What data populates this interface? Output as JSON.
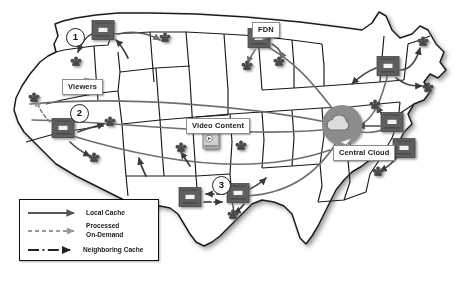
{
  "figure": {
    "kind": "network-diagram",
    "basemap": "united-states-map",
    "background_color": "#ffffff",
    "map_fill": "#ffffff",
    "map_stroke": "#1a1a1a",
    "accent_gray": "#6f6f6f",
    "server_color": "#5e5e5e",
    "cloud_circle_color": "#8c8c8c"
  },
  "labels": [
    {
      "id": "viewers",
      "text": "Viewers",
      "x": 62,
      "y": 79
    },
    {
      "id": "fdn",
      "text": "FDN",
      "x": 252,
      "y": 22
    },
    {
      "id": "video_content",
      "text": "Video Content",
      "x": 186,
      "y": 118
    },
    {
      "id": "central_cloud",
      "text": "Central Cloud",
      "x": 333,
      "y": 145
    }
  ],
  "markers": [
    {
      "id": "marker-1",
      "text": "1",
      "x": 66,
      "y": 28
    },
    {
      "id": "marker-2",
      "text": "2",
      "x": 70,
      "y": 104
    },
    {
      "id": "marker-3",
      "text": "3",
      "x": 212,
      "y": 176
    }
  ],
  "legend": {
    "title": "",
    "items": [
      {
        "id": "local-cache",
        "label": "Local Cache",
        "style": "solid",
        "color": "#555555"
      },
      {
        "id": "processed-on-demand",
        "label": "Processed\nOn-Demand",
        "style": "dashed",
        "color": "#9a9a9a"
      },
      {
        "id": "neighboring-cache",
        "label": "Neighboring Cache",
        "style": "dash-dot",
        "color": "#222222"
      }
    ],
    "line1": "Local Cache",
    "line2a": "Processed",
    "line2b": "On-Demand",
    "line3": "Neighboring Cache"
  },
  "nodes": {
    "servers": [
      {
        "id": "server-oregon",
        "x": 103,
        "y": 30
      },
      {
        "id": "server-california",
        "x": 63,
        "y": 128
      },
      {
        "id": "server-fdn-mn",
        "x": 259,
        "y": 38
      },
      {
        "id": "server-texas-w",
        "x": 190,
        "y": 197
      },
      {
        "id": "server-texas-e",
        "x": 238,
        "y": 193
      },
      {
        "id": "server-newyork",
        "x": 388,
        "y": 66
      },
      {
        "id": "server-midatl",
        "x": 392,
        "y": 122
      },
      {
        "id": "server-southeast",
        "x": 404,
        "y": 148
      }
    ],
    "viewer_clusters": [
      {
        "id": "viewers-oregon",
        "x": 76,
        "y": 62
      },
      {
        "id": "viewers-montana",
        "x": 165,
        "y": 38
      },
      {
        "id": "viewers-norcal",
        "x": 34,
        "y": 98
      },
      {
        "id": "viewers-nevada",
        "x": 110,
        "y": 122
      },
      {
        "id": "viewers-socal",
        "x": 94,
        "y": 158
      },
      {
        "id": "viewers-mn-a",
        "x": 247,
        "y": 66
      },
      {
        "id": "viewers-mn-b",
        "x": 279,
        "y": 62
      },
      {
        "id": "viewers-kansas",
        "x": 181,
        "y": 148
      },
      {
        "id": "viewers-missouri",
        "x": 241,
        "y": 146
      },
      {
        "id": "viewers-texas",
        "x": 233,
        "y": 215
      },
      {
        "id": "viewers-newengl",
        "x": 423,
        "y": 42
      },
      {
        "id": "viewers-ny",
        "x": 428,
        "y": 88
      },
      {
        "id": "viewers-penn",
        "x": 375,
        "y": 105
      },
      {
        "id": "viewers-carolina",
        "x": 378,
        "y": 172
      }
    ],
    "cloud": {
      "id": "central-cloud",
      "x": 342,
      "y": 125,
      "r": 20
    },
    "video": {
      "id": "video-content-icon",
      "x": 211,
      "y": 140
    }
  },
  "icons": {
    "cloud": "cloud-icon",
    "server": "server-rack-icon",
    "viewers": "viewer-cluster-icon",
    "video": "video-file-icon"
  }
}
